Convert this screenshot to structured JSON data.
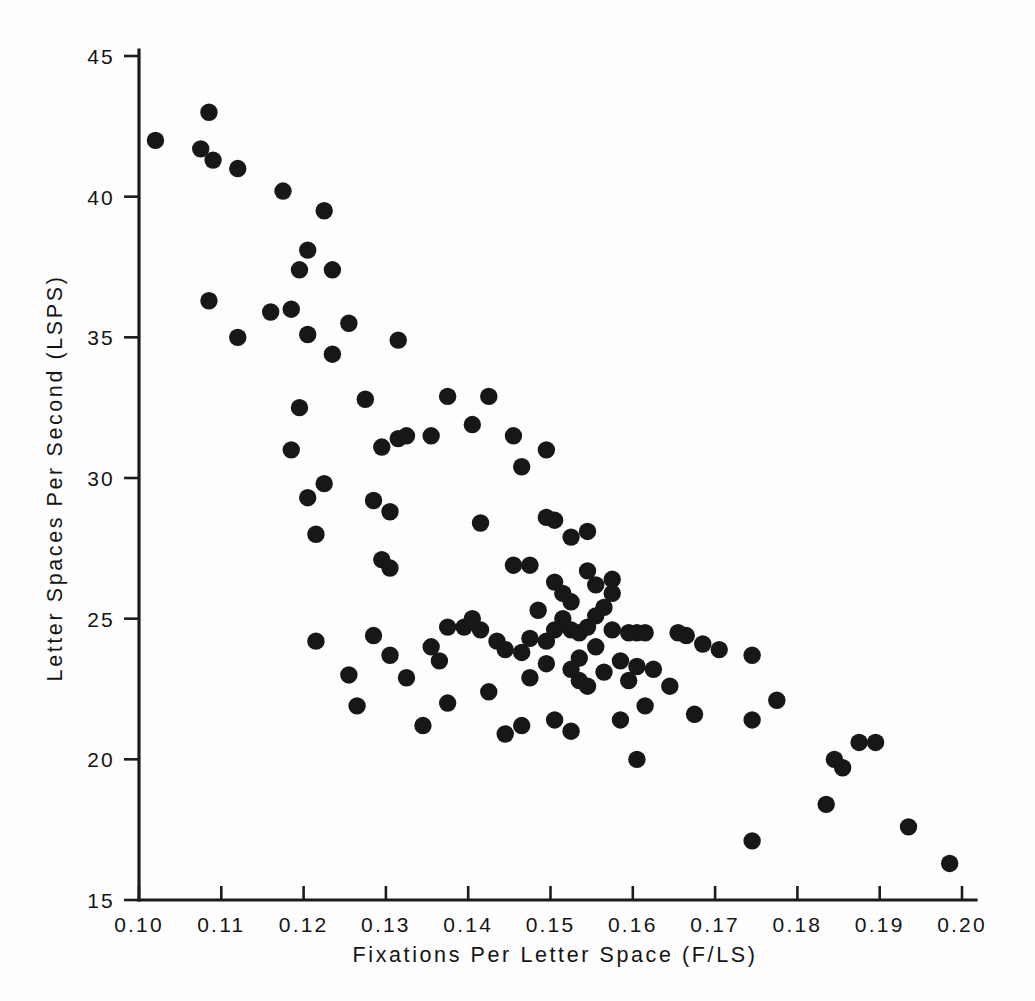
{
  "chart_data": {
    "type": "scatter",
    "title": "",
    "xlabel": "Fixations Per Letter Space (F/LS)",
    "ylabel": "Letter Spaces Per Second (LSPS)",
    "xlim": [
      0.1,
      0.2
    ],
    "ylim": [
      15,
      45
    ],
    "xticks": [
      0.1,
      0.11,
      0.12,
      0.13,
      0.14,
      0.15,
      0.16,
      0.17,
      0.18,
      0.19,
      0.2
    ],
    "xtick_labels": [
      "0.10",
      "0.11",
      "0.12",
      "0.13",
      "0.14",
      "0.15",
      "0.16",
      "0.17",
      "0.18",
      "0.19",
      "0.20"
    ],
    "yticks": [
      15,
      20,
      25,
      30,
      35,
      40,
      45
    ],
    "ytick_labels": [
      "15",
      "20",
      "25",
      "30",
      "35",
      "40",
      "45"
    ],
    "grid": false,
    "legend": null,
    "marker": "filled-circle",
    "marker_color": "#17171a",
    "marker_size": 9,
    "n_points": 118,
    "points": [
      [
        0.102,
        42.0
      ],
      [
        0.1085,
        43.0
      ],
      [
        0.1075,
        41.7
      ],
      [
        0.109,
        41.3
      ],
      [
        0.112,
        41.0
      ],
      [
        0.1085,
        36.3
      ],
      [
        0.112,
        35.0
      ],
      [
        0.1175,
        40.2
      ],
      [
        0.1205,
        38.1
      ],
      [
        0.1225,
        39.5
      ],
      [
        0.1195,
        37.4
      ],
      [
        0.1235,
        37.4
      ],
      [
        0.116,
        35.9
      ],
      [
        0.1185,
        36.0
      ],
      [
        0.1205,
        35.1
      ],
      [
        0.1255,
        35.5
      ],
      [
        0.1235,
        34.4
      ],
      [
        0.1315,
        34.9
      ],
      [
        0.1195,
        32.5
      ],
      [
        0.1275,
        32.8
      ],
      [
        0.1185,
        31.0
      ],
      [
        0.1295,
        31.1
      ],
      [
        0.1225,
        29.8
      ],
      [
        0.1205,
        29.3
      ],
      [
        0.1215,
        28.0
      ],
      [
        0.1285,
        29.2
      ],
      [
        0.1305,
        28.8
      ],
      [
        0.1295,
        27.1
      ],
      [
        0.1315,
        31.4
      ],
      [
        0.1325,
        31.5
      ],
      [
        0.1355,
        31.5
      ],
      [
        0.1305,
        26.8
      ],
      [
        0.1375,
        32.9
      ],
      [
        0.1405,
        31.9
      ],
      [
        0.1425,
        32.9
      ],
      [
        0.1455,
        31.5
      ],
      [
        0.1495,
        31.0
      ],
      [
        0.1465,
        30.4
      ],
      [
        0.1415,
        28.4
      ],
      [
        0.1495,
        28.6
      ],
      [
        0.1505,
        28.5
      ],
      [
        0.1525,
        27.9
      ],
      [
        0.1545,
        28.1
      ],
      [
        0.1455,
        26.9
      ],
      [
        0.1475,
        26.9
      ],
      [
        0.1505,
        26.3
      ],
      [
        0.1515,
        25.9
      ],
      [
        0.1545,
        26.7
      ],
      [
        0.1555,
        26.2
      ],
      [
        0.1575,
        25.9
      ],
      [
        0.1375,
        24.7
      ],
      [
        0.1395,
        24.7
      ],
      [
        0.1415,
        24.6
      ],
      [
        0.1435,
        24.2
      ],
      [
        0.1475,
        24.3
      ],
      [
        0.1495,
        24.2
      ],
      [
        0.1505,
        24.6
      ],
      [
        0.1515,
        25.0
      ],
      [
        0.1525,
        24.6
      ],
      [
        0.1535,
        24.5
      ],
      [
        0.1545,
        24.7
      ],
      [
        0.1535,
        23.6
      ],
      [
        0.1525,
        23.2
      ],
      [
        0.1535,
        22.8
      ],
      [
        0.1545,
        22.6
      ],
      [
        0.1555,
        24.0
      ],
      [
        0.1565,
        25.4
      ],
      [
        0.1575,
        24.6
      ],
      [
        0.1595,
        24.5
      ],
      [
        0.1605,
        24.5
      ],
      [
        0.1615,
        24.5
      ],
      [
        0.1585,
        23.5
      ],
      [
        0.1605,
        23.3
      ],
      [
        0.1625,
        23.2
      ],
      [
        0.1645,
        22.6
      ],
      [
        0.1655,
        24.5
      ],
      [
        0.1665,
        24.4
      ],
      [
        0.1685,
        24.1
      ],
      [
        0.1705,
        23.9
      ],
      [
        0.1745,
        23.7
      ],
      [
        0.1465,
        21.2
      ],
      [
        0.1505,
        21.4
      ],
      [
        0.1525,
        21.0
      ],
      [
        0.1585,
        21.4
      ],
      [
        0.1605,
        20.0
      ],
      [
        0.1745,
        21.4
      ],
      [
        0.1775,
        22.1
      ],
      [
        0.1835,
        18.4
      ],
      [
        0.1845,
        20.0
      ],
      [
        0.1855,
        19.7
      ],
      [
        0.1875,
        20.6
      ],
      [
        0.1895,
        20.6
      ],
      [
        0.1935,
        17.6
      ],
      [
        0.1985,
        16.3
      ],
      [
        0.1745,
        17.1
      ],
      [
        0.1215,
        24.2
      ],
      [
        0.1285,
        24.4
      ],
      [
        0.1305,
        23.7
      ],
      [
        0.1325,
        22.9
      ],
      [
        0.1265,
        21.9
      ],
      [
        0.1345,
        21.2
      ],
      [
        0.1405,
        25.0
      ],
      [
        0.1445,
        23.9
      ],
      [
        0.1465,
        23.8
      ],
      [
        0.1565,
        23.1
      ],
      [
        0.1595,
        22.8
      ],
      [
        0.1425,
        22.4
      ],
      [
        0.1525,
        25.6
      ],
      [
        0.1555,
        25.1
      ],
      [
        0.1485,
        25.3
      ],
      [
        0.1575,
        26.4
      ],
      [
        0.1495,
        23.4
      ],
      [
        0.1475,
        22.9
      ],
      [
        0.1355,
        24.0
      ],
      [
        0.1365,
        23.5
      ],
      [
        0.1615,
        21.9
      ],
      [
        0.1675,
        21.6
      ],
      [
        0.1445,
        20.9
      ],
      [
        0.1375,
        22.0
      ],
      [
        0.1255,
        23.0
      ]
    ]
  },
  "axes": {
    "x_axis_name": "x-axis",
    "y_axis_name": "y-axis"
  }
}
